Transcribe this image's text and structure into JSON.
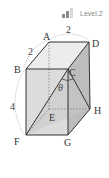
{
  "badge": {
    "label": "Level.2",
    "bars_filled": 2,
    "bars_total": 3
  },
  "diagram": {
    "type": "rectangular-prism",
    "vertices": {
      "A": {
        "label": "A",
        "x": 49,
        "y": 42
      },
      "D": {
        "label": "D",
        "x": 89,
        "y": 42
      },
      "B": {
        "label": "B",
        "x": 26,
        "y": 69
      },
      "C": {
        "label": "C",
        "x": 68,
        "y": 69
      },
      "E": {
        "label": "E",
        "x": 49,
        "y": 109
      },
      "H": {
        "label": "H",
        "x": 90,
        "y": 109
      },
      "F": {
        "label": "F",
        "x": 26,
        "y": 135
      },
      "G": {
        "label": "G",
        "x": 68,
        "y": 135
      }
    },
    "dimensions": {
      "AB": "2",
      "AD": "2",
      "BF": "4"
    },
    "angle": {
      "label": "θ",
      "vertex": "C",
      "between": [
        "CF",
        "CH"
      ]
    }
  }
}
